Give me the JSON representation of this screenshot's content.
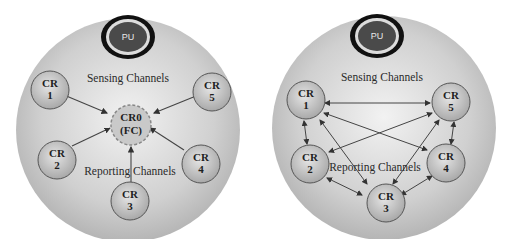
{
  "diagrams": [
    {
      "name": "centralized",
      "pu_label": "PU",
      "sensing_label": "Sensing Channels",
      "reporting_label": "Reporting Channels",
      "fusion_center": {
        "line1": "CR0",
        "line2": "(FC)"
      },
      "nodes": [
        {
          "line1": "CR",
          "line2": "1"
        },
        {
          "line1": "CR",
          "line2": "2"
        },
        {
          "line1": "CR",
          "line2": "3"
        },
        {
          "line1": "CR",
          "line2": "4"
        },
        {
          "line1": "CR",
          "line2": "5"
        }
      ]
    },
    {
      "name": "distributed",
      "pu_label": "PU",
      "sensing_label": "Sensing Channels",
      "reporting_label": "Reporting Channels",
      "nodes": [
        {
          "line1": "CR",
          "line2": "1"
        },
        {
          "line1": "CR",
          "line2": "2"
        },
        {
          "line1": "CR",
          "line2": "3"
        },
        {
          "line1": "CR",
          "line2": "4"
        },
        {
          "line1": "CR",
          "line2": "5"
        }
      ]
    }
  ],
  "colors": {
    "background_circle": "#c8c8c8",
    "node_fill": "#bdbdbd",
    "pu_fill": "#4a4a4a",
    "edge": "#444444"
  }
}
